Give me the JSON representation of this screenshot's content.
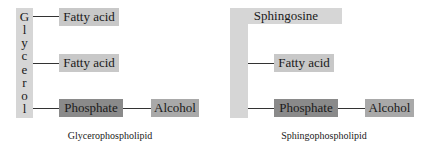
{
  "glycerophospholipid": {
    "backbone": "Glycerol",
    "backbone_letters": [
      "G",
      "l",
      "y",
      "c",
      "e",
      "r",
      "o",
      "l"
    ],
    "fatty_acid_1": "Fatty acid",
    "fatty_acid_2": "Fatty acid",
    "phosphate": "Phosphate",
    "alcohol": "Alcohol",
    "caption": "Glycerophospholipid"
  },
  "sphingophospholipid": {
    "backbone": "Sphingosine",
    "fatty_acid": "Fatty acid",
    "phosphate": "Phosphate",
    "alcohol": "Alcohol",
    "caption": "Sphingophospholipid"
  },
  "colors": {
    "backbone": "#d6d6d6",
    "fatty_acid": "#b0b0b0",
    "phosphate": "#8a8a8a",
    "alcohol": "#a9a9a9"
  }
}
